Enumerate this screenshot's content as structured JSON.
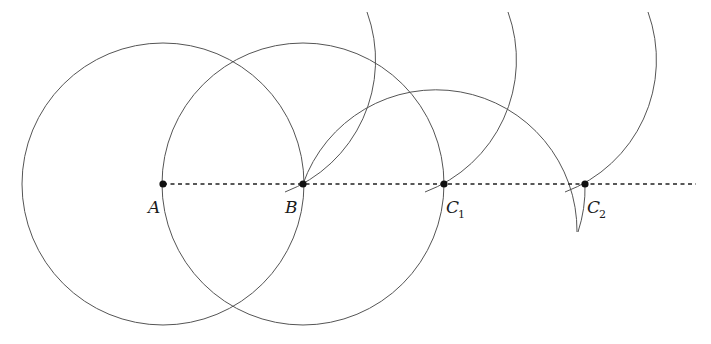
{
  "diagram": {
    "title": "",
    "radius": 141,
    "colors": {
      "stroke": "#555555",
      "point": "#111111",
      "dash": "#222222"
    },
    "points": [
      {
        "id": "A",
        "label": "A",
        "subscript": "",
        "x": 163,
        "y": 184
      },
      {
        "id": "B",
        "label": "B",
        "subscript": "",
        "x": 303,
        "y": 184
      },
      {
        "id": "C1",
        "label": "C",
        "subscript": "1",
        "x": 444,
        "y": 184
      },
      {
        "id": "C2",
        "label": "C",
        "subscript": "2",
        "x": 585,
        "y": 184
      }
    ],
    "baseline": {
      "style": "dashed",
      "x1": 163,
      "x2": 696,
      "y": 184
    },
    "circles": [
      {
        "center": "A",
        "kind": "full"
      },
      {
        "center": "B",
        "kind": "full"
      },
      {
        "center": "C1",
        "kind": "partial-upper"
      }
    ],
    "arcs": [
      {
        "center": [
          233,
          62
        ],
        "through": "B"
      },
      {
        "center": [
          373,
          62
        ],
        "through": "C1"
      },
      {
        "center": [
          514,
          62
        ],
        "through": "C2"
      }
    ]
  }
}
